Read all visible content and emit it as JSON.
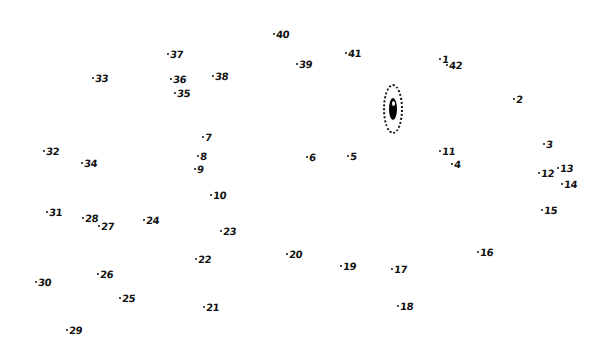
{
  "puzzle": {
    "type": "connect-the-dots",
    "total_points": 42,
    "eye": {
      "x": 383,
      "y": 84,
      "color": "#111111"
    },
    "points": [
      {
        "n": "1",
        "x": 439,
        "y": 58
      },
      {
        "n": "2",
        "x": 513,
        "y": 98
      },
      {
        "n": "3",
        "x": 543,
        "y": 143
      },
      {
        "n": "4",
        "x": 451,
        "y": 163
      },
      {
        "n": "5",
        "x": 347,
        "y": 155
      },
      {
        "n": "6",
        "x": 306,
        "y": 156
      },
      {
        "n": "7",
        "x": 202,
        "y": 136
      },
      {
        "n": "8",
        "x": 197,
        "y": 155
      },
      {
        "n": "9",
        "x": 194,
        "y": 168
      },
      {
        "n": "10",
        "x": 210,
        "y": 194
      },
      {
        "n": "11",
        "x": 439,
        "y": 150
      },
      {
        "n": "12",
        "x": 538,
        "y": 172
      },
      {
        "n": "13",
        "x": 557,
        "y": 167
      },
      {
        "n": "14",
        "x": 561,
        "y": 183
      },
      {
        "n": "15",
        "x": 541,
        "y": 209
      },
      {
        "n": "16",
        "x": 477,
        "y": 251
      },
      {
        "n": "17",
        "x": 391,
        "y": 268
      },
      {
        "n": "18",
        "x": 397,
        "y": 305
      },
      {
        "n": "19",
        "x": 340,
        "y": 265
      },
      {
        "n": "20",
        "x": 286,
        "y": 253
      },
      {
        "n": "21",
        "x": 203,
        "y": 306
      },
      {
        "n": "22",
        "x": 195,
        "y": 258
      },
      {
        "n": "23",
        "x": 220,
        "y": 230
      },
      {
        "n": "24",
        "x": 143,
        "y": 219
      },
      {
        "n": "25",
        "x": 119,
        "y": 297
      },
      {
        "n": "26",
        "x": 97,
        "y": 273
      },
      {
        "n": "27",
        "x": 98,
        "y": 225
      },
      {
        "n": "28",
        "x": 82,
        "y": 217
      },
      {
        "n": "29",
        "x": 66,
        "y": 329
      },
      {
        "n": "30",
        "x": 35,
        "y": 281
      },
      {
        "n": "31",
        "x": 46,
        "y": 211
      },
      {
        "n": "32",
        "x": 43,
        "y": 150
      },
      {
        "n": "33",
        "x": 92,
        "y": 77
      },
      {
        "n": "34",
        "x": 81,
        "y": 162
      },
      {
        "n": "35",
        "x": 174,
        "y": 92
      },
      {
        "n": "36",
        "x": 170,
        "y": 78
      },
      {
        "n": "37",
        "x": 167,
        "y": 53
      },
      {
        "n": "38",
        "x": 212,
        "y": 75
      },
      {
        "n": "39",
        "x": 296,
        "y": 63
      },
      {
        "n": "40",
        "x": 273,
        "y": 33
      },
      {
        "n": "41",
        "x": 345,
        "y": 52
      },
      {
        "n": "42",
        "x": 446,
        "y": 64
      }
    ]
  }
}
